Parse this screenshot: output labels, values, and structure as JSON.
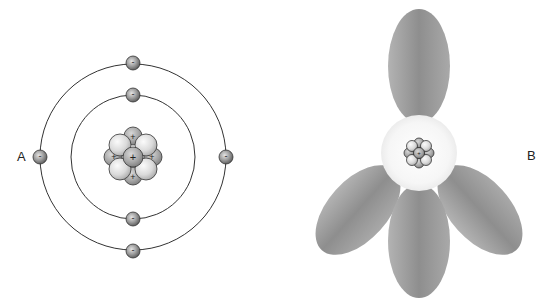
{
  "diagram": {
    "panels": [
      {
        "id": "A",
        "label": "A",
        "model": "Bohr planetary model",
        "nucleus": {
          "protons_visible": 5,
          "proton_symbol": "+",
          "neutrons_visible": 4
        },
        "orbits": [
          {
            "name": "inner shell",
            "electrons": 2
          },
          {
            "name": "outer shell",
            "electrons": 4
          }
        ],
        "electron_symbol": "-"
      },
      {
        "id": "B",
        "label": "B",
        "model": "Electron cloud / orbital model",
        "nucleus": {
          "proton_symbol": "+"
        },
        "lobes": 4
      }
    ],
    "colors": {
      "orbit_line": "#333333",
      "electron_light": "#d0d0d0",
      "electron_dark": "#5a5a5a",
      "nucleus_light": "#f2f2f2",
      "nucleus_dark": "#9a9a9a",
      "lobe_light": "#b8b8b8",
      "lobe_dark": "#8a8a8a",
      "cloud_center": "#f7f7f7"
    }
  }
}
